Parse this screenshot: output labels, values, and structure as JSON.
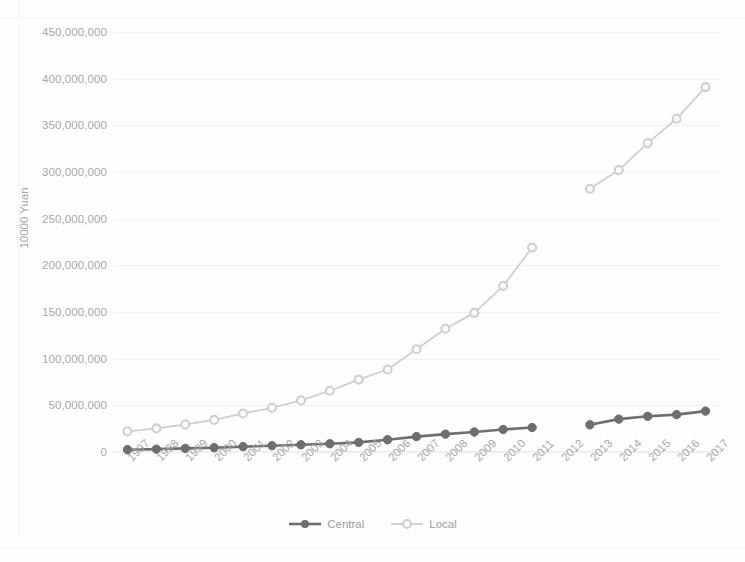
{
  "chart_data": {
    "type": "line",
    "title": "",
    "subtitle": "",
    "xlabel": "",
    "ylabel": "10000 Yuan",
    "grid": true,
    "legend_position": "bottom",
    "xlim": [
      1997,
      2017
    ],
    "ylim": [
      0,
      450000000
    ],
    "y_tick_interval": 50000000,
    "categories": [
      "1997",
      "1998",
      "1999",
      "2000",
      "2001",
      "2002",
      "2003",
      "2004",
      "2005",
      "2006",
      "2007",
      "2008",
      "2009",
      "2010",
      "2011",
      "2012",
      "2013",
      "2014",
      "2015",
      "2016",
      "2017"
    ],
    "y_tick_labels": [
      "450,000,000",
      "400,000,000",
      "350,000,000",
      "300,000,000",
      "250,000,000",
      "200,000,000",
      "150,000,000",
      "100,000,000",
      "50,000,000",
      "0"
    ],
    "y_tick_values": [
      450000000,
      400000000,
      350000000,
      300000000,
      250000000,
      200000000,
      150000000,
      100000000,
      50000000,
      0
    ],
    "note": "Both series have a missing data point at 2012 producing a visible gap in each line.",
    "series": [
      {
        "name": "Central",
        "color": "#6e6e6e",
        "marker": "filled-circle",
        "values": [
          2500000,
          3100000,
          3900000,
          4600000,
          5800000,
          6800000,
          7700000,
          8900000,
          10300000,
          13200000,
          16500000,
          19200000,
          21400000,
          24100000,
          26200000,
          null,
          29100000,
          35200000,
          38200000,
          40100000,
          43800000
        ]
      },
      {
        "name": "Local",
        "color": "#cfcfcf",
        "marker": "hollow-circle",
        "values": [
          22200000,
          25300000,
          29500000,
          34400000,
          41300000,
          47400000,
          55300000,
          65600000,
          77600000,
          88400000,
          110000000,
          132000000,
          149000000,
          178000000,
          219000000,
          null,
          282000000,
          302000000,
          331000000,
          357000000,
          391000000
        ]
      }
    ]
  },
  "legend": {
    "items": [
      {
        "label": "Central",
        "color": "#6e6e6e"
      },
      {
        "label": "Local",
        "color": "#cfcfcf"
      }
    ]
  },
  "axes": {
    "y_title": "10000 Yuan"
  }
}
